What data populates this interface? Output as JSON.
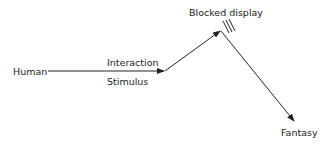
{
  "diagram": {
    "nodes": {
      "human": "Human",
      "blocked": "Blocked display",
      "fantasy": "Fantasy"
    },
    "edge_labels": {
      "interaction": "Interaction",
      "stimulus": "Stimulus"
    },
    "colors": {
      "stroke": "#222222",
      "text": "#222222"
    }
  }
}
